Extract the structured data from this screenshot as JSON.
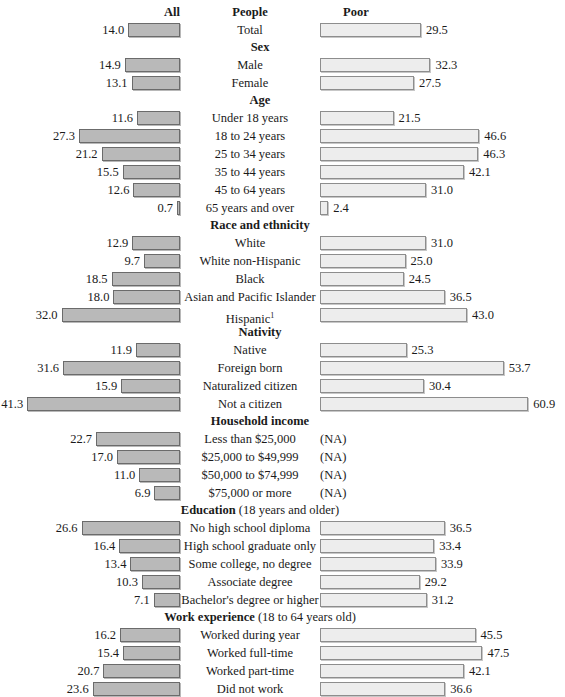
{
  "header": {
    "left_label": "All",
    "center_label": "People",
    "right_label": "Poor"
  },
  "footnote_marker": "1",
  "colors": {
    "all_bar_fill": "#b9b9b9",
    "all_bar_border": "#6b6b6b",
    "poor_bar_fill": "#ededed",
    "poor_bar_border": "#8d8d8d",
    "text": "#1a1a1a",
    "background": "#ffffff"
  },
  "na_label": "(NA)",
  "chart_data": {
    "type": "bar",
    "title": "",
    "subtitle": "",
    "xlabel": "",
    "ylabel": "",
    "grid": false,
    "legend_position": "top",
    "orientation": "horizontal",
    "layout": "diverging-paired",
    "series": [
      {
        "name": "All",
        "align": "right",
        "values_note": "percent"
      },
      {
        "name": "Poor",
        "align": "left",
        "values_note": "percent"
      }
    ],
    "axis_ranges": {
      "all": [
        0,
        41.3
      ],
      "poor": [
        0,
        60.9
      ]
    },
    "groups": [
      {
        "heading": "",
        "heading_sub": "",
        "rows": [
          {
            "label": "Total",
            "all": 14.0,
            "poor": 29.5
          }
        ]
      },
      {
        "heading": "Sex",
        "heading_sub": "",
        "rows": [
          {
            "label": "Male",
            "all": 14.9,
            "poor": 32.3
          },
          {
            "label": "Female",
            "all": 13.1,
            "poor": 27.5
          }
        ]
      },
      {
        "heading": "Age",
        "heading_sub": "",
        "rows": [
          {
            "label": "Under 18 years",
            "all": 11.6,
            "poor": 21.5
          },
          {
            "label": "18 to 24 years",
            "all": 27.3,
            "poor": 46.6
          },
          {
            "label": "25 to 34 years",
            "all": 21.2,
            "poor": 46.3
          },
          {
            "label": "35 to 44 years",
            "all": 15.5,
            "poor": 42.1
          },
          {
            "label": "45 to 64 years",
            "all": 12.6,
            "poor": 31.0
          },
          {
            "label": "65 years and over",
            "all": 0.7,
            "poor": 2.4
          }
        ]
      },
      {
        "heading": "Race and ethnicity",
        "heading_sub": "",
        "rows": [
          {
            "label": "White",
            "all": 12.9,
            "poor": 31.0
          },
          {
            "label": "White non-Hispanic",
            "all": 9.7,
            "poor": 25.0
          },
          {
            "label": "Black",
            "all": 18.5,
            "poor": 24.5
          },
          {
            "label": "Asian and Pacific Islander",
            "all": 18.0,
            "poor": 36.5
          },
          {
            "label": "Hispanic",
            "footnote": "1",
            "all": 32.0,
            "poor": 43.0
          }
        ]
      },
      {
        "heading": "Nativity",
        "heading_sub": "",
        "rows": [
          {
            "label": "Native",
            "all": 11.9,
            "poor": 25.3
          },
          {
            "label": "Foreign born",
            "all": 31.6,
            "poor": 53.7
          },
          {
            "label": "Naturalized citizen",
            "all": 15.9,
            "poor": 30.4
          },
          {
            "label": "Not a citizen",
            "all": 41.3,
            "poor": 60.9
          }
        ]
      },
      {
        "heading": "Household income",
        "heading_sub": "",
        "rows": [
          {
            "label": "Less than $25,000",
            "all": 22.7,
            "poor": null
          },
          {
            "label": "$25,000 to $49,999",
            "all": 17.0,
            "poor": null
          },
          {
            "label": "$50,000 to $74,999",
            "all": 11.0,
            "poor": null
          },
          {
            "label": "$75,000 or more",
            "all": 6.9,
            "poor": null
          }
        ]
      },
      {
        "heading": "Education",
        "heading_sub": "(18 years and older)",
        "rows": [
          {
            "label": "No high school diploma",
            "all": 26.6,
            "poor": 36.5
          },
          {
            "label": "High school graduate only",
            "all": 16.4,
            "poor": 33.4
          },
          {
            "label": "Some college, no degree",
            "all": 13.4,
            "poor": 33.9
          },
          {
            "label": "Associate degree",
            "all": 10.3,
            "poor": 29.2
          },
          {
            "label": "Bachelor's degree or higher",
            "all": 7.1,
            "poor": 31.2
          }
        ]
      },
      {
        "heading": "Work experience",
        "heading_sub": "(18 to 64 years old)",
        "rows": [
          {
            "label": "Worked during year",
            "all": 16.2,
            "poor": 45.5
          },
          {
            "label": "Worked full-time",
            "all": 15.4,
            "poor": 47.5
          },
          {
            "label": "Worked part-time",
            "all": 20.7,
            "poor": 42.1
          },
          {
            "label": "Did not work",
            "all": 23.6,
            "poor": 36.6
          }
        ]
      }
    ]
  }
}
